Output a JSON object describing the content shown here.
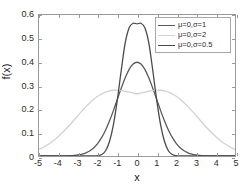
{
  "chart_data": {
    "type": "line",
    "title": "",
    "xlabel": "x",
    "ylabel": "f(x)",
    "xlim": [
      -5,
      5
    ],
    "ylim": [
      0,
      0.6
    ],
    "xticks": [
      "-5",
      "-4",
      "-3",
      "-2",
      "-1",
      "0",
      "1",
      "2",
      "3",
      "4",
      "5"
    ],
    "xtick_values": [
      -5,
      -4,
      -3,
      -2,
      -1,
      0,
      1,
      2,
      3,
      4,
      5
    ],
    "yticks": [
      "0",
      "0.1",
      "0.2",
      "0.3",
      "0.4",
      "0.5",
      "0.6"
    ],
    "ytick_values": [
      0,
      0.1,
      0.2,
      0.3,
      0.4,
      0.5,
      0.6
    ],
    "grid": false,
    "legend_position": "upper-right",
    "x": [
      -5,
      -4.8,
      -4.6,
      -4.4,
      -4.2,
      -4,
      -3.8,
      -3.6,
      -3.4,
      -3.2,
      -3,
      -2.8,
      -2.6,
      -2.4,
      -2.2,
      -2,
      -1.8,
      -1.6,
      -1.4,
      -1.2,
      -1,
      -0.8,
      -0.6,
      -0.4,
      -0.2,
      0,
      0.2,
      0.4,
      0.6,
      0.8,
      1,
      1.2,
      1.4,
      1.6,
      1.8,
      2,
      2.2,
      2.4,
      2.6,
      2.8,
      3,
      3.2,
      3.4,
      3.6,
      3.8,
      4,
      4.2,
      4.4,
      4.6,
      4.8,
      5
    ],
    "series": [
      {
        "name": "μ=0,σ=1",
        "color": "#5a5a5a",
        "peak": 0.399,
        "values": [
          1.5e-06,
          3.9e-06,
          1.01e-05,
          2.49e-05,
          5.89e-05,
          0.0001338,
          0.0002919,
          0.0006119,
          0.0012322,
          0.0023841,
          0.0044318,
          0.0079155,
          0.013583,
          0.0223945,
          0.0354746,
          0.053991,
          0.0789502,
          0.1109208,
          0.1497275,
          0.1941861,
          0.2419707,
          0.2896916,
          0.3332246,
          0.3682701,
          0.3910427,
          0.3989423,
          0.3910427,
          0.3682701,
          0.3332246,
          0.2896916,
          0.2419707,
          0.1941861,
          0.1497275,
          0.1109208,
          0.0789502,
          0.053991,
          0.0354746,
          0.0223945,
          0.013583,
          0.0079155,
          0.0044318,
          0.0023841,
          0.0012322,
          0.0006119,
          0.0002919,
          0.0001338,
          5.89e-05,
          2.49e-05,
          1.01e-05,
          3.9e-06,
          1.5e-06
        ]
      },
      {
        "name": "μ=0,σ=2",
        "color": "#d2d2d2",
        "peak": 0.28,
        "values": [
          0.0175283,
          0.0223842,
          0.0282067,
          0.0350566,
          0.0429557,
          0.0518806,
          0.0617563,
          0.0724525,
          0.0837832,
          0.0955111,
          0.1073565,
          0.1190107,
          0.1301528,
          0.1404688,
          0.1496723,
          0.1575251,
          0.1638554,
          0.1685709,
          0.1716651,
          0.1732188,
          0.1733968,
          0.17244,
          0.1706542,
          0.1683952,
          0.1660514,
          0.1640232,
          0.1660514,
          0.1683952,
          0.1706542,
          0.17244,
          0.1733968,
          0.1732188,
          0.1716651,
          0.1685709,
          0.1638554,
          0.1575251,
          0.1496723,
          0.1404688,
          0.1301528,
          0.1190107,
          0.1073565,
          0.0955111,
          0.0837832,
          0.0724525,
          0.0617563,
          0.0518806,
          0.0429557,
          0.0350566,
          0.0282067,
          0.0223842,
          0.0175283
        ]
      },
      {
        "name": "μ=0,σ=0.5",
        "color": "#4a4a4a",
        "peak": 0.565,
        "values": [
          0,
          0,
          0,
          0,
          0,
          0,
          0,
          0,
          0,
          0,
          0,
          1e-07,
          1.5e-06,
          2.01e-05,
          0.0002027,
          0.0013383,
          0.0062462,
          0.0225283,
          0.0628435,
          0.1353353,
          0.2419707,
          0.3683161,
          0.4838783,
          0.5479929,
          0.5671826,
          0.5641896,
          0.5671826,
          0.5479929,
          0.4838783,
          0.3683161,
          0.2419707,
          0.1353353,
          0.0628435,
          0.0225283,
          0.0062462,
          0.0013383,
          0.0002027,
          2.01e-05,
          1.5e-06,
          1e-07,
          0,
          0,
          0,
          0,
          0,
          0,
          0,
          0,
          0,
          0,
          0
        ]
      }
    ]
  },
  "axis": {
    "xlabel": "x",
    "ylabel": "f(x)"
  },
  "legend": {
    "entries": [
      {
        "label": "μ=0,σ=1"
      },
      {
        "label": "μ=0,σ=2"
      },
      {
        "label": "μ=0,σ=0.5"
      }
    ]
  },
  "colors": {
    "sigma1": "#5a5a5a",
    "sigma2": "#d2d2d2",
    "sigma05": "#4a4a4a",
    "axis": "#9a9a9a",
    "text": "#2b2b2b",
    "background": "#ffffff"
  }
}
